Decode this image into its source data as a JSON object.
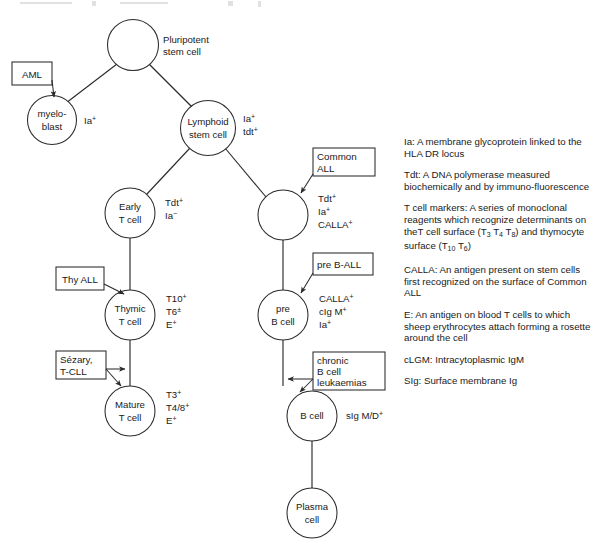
{
  "diagram": {
    "title_fragment": "",
    "nodes": [
      {
        "id": "pluripotent",
        "label_lines": [
          "Pluripotent",
          "stem cell"
        ],
        "label_position": "right",
        "markers": []
      },
      {
        "id": "myeloblast",
        "label_lines": [
          "myelo-",
          "blast"
        ],
        "label_position": "inside",
        "markers": [
          {
            "base": "Ia",
            "sup": "+"
          }
        ]
      },
      {
        "id": "lymphoid",
        "label_lines": [
          "Lymphoid",
          "stem cell"
        ],
        "label_position": "inside",
        "markers": [
          {
            "base": "Ia",
            "sup": "+"
          },
          {
            "base": "tdt",
            "sup": "+"
          }
        ]
      },
      {
        "id": "early-t",
        "label_lines": [
          "Early",
          "T cell"
        ],
        "label_position": "inside",
        "markers": [
          {
            "base": "Tdt",
            "sup": "+"
          },
          {
            "base": "Ia",
            "sup": "−"
          }
        ]
      },
      {
        "id": "common-all",
        "label_lines": [],
        "label_position": "inside",
        "markers": [
          {
            "base": "Tdt",
            "sup": "+"
          },
          {
            "base": "Ia",
            "sup": "+"
          },
          {
            "base": "CALLA",
            "sup": "+"
          }
        ]
      },
      {
        "id": "thymic-t",
        "label_lines": [
          "Thymic",
          "T cell"
        ],
        "label_position": "inside",
        "markers": [
          {
            "base": "T10",
            "sup": "+"
          },
          {
            "base": "T6",
            "sup": "±"
          },
          {
            "base": "E",
            "sup": "+"
          }
        ]
      },
      {
        "id": "pre-b",
        "label_lines": [
          "pre",
          "B cell"
        ],
        "label_position": "inside",
        "markers": [
          {
            "base": "CALLA",
            "sup": "+"
          },
          {
            "base": "cIg M",
            "sup": "+"
          },
          {
            "base": "Ia",
            "sup": "+"
          }
        ]
      },
      {
        "id": "mature-t",
        "label_lines": [
          "Mature",
          "T cell"
        ],
        "label_position": "inside",
        "markers": [
          {
            "base": "T3",
            "sup": "+"
          },
          {
            "base": "T4/8",
            "sup": "+"
          },
          {
            "base": "E",
            "sup": "+"
          }
        ]
      },
      {
        "id": "b-cell",
        "label_lines": [
          "B cell"
        ],
        "label_position": "inside",
        "markers": [
          {
            "base": "sIg M/D",
            "sup": "+"
          }
        ]
      },
      {
        "id": "plasma",
        "label_lines": [
          "Plasma",
          "cell"
        ],
        "label_position": "inside",
        "markers": []
      }
    ],
    "disease_boxes": [
      {
        "id": "aml",
        "lines": [
          "AML"
        ],
        "target": "myeloblast"
      },
      {
        "id": "thy-all",
        "lines": [
          "Thy ALL"
        ],
        "target": "thymic-t"
      },
      {
        "id": "sezary-tcll",
        "lines": [
          "Sézary,",
          "T-CLL"
        ],
        "target": "mature-t"
      },
      {
        "id": "common-all-box",
        "lines": [
          "Common",
          "ALL"
        ],
        "target": "common-all"
      },
      {
        "id": "pre-b-all",
        "lines": [
          "pre B-ALL"
        ],
        "target": "pre-b"
      },
      {
        "id": "chronic-b",
        "lines": [
          "chronic",
          "B cell",
          "leukaemias"
        ],
        "target": "b-cell"
      }
    ]
  },
  "legend": {
    "entries": [
      {
        "id": "ia",
        "html": "Ia: A membrane glycoprotein linked to the HLA DR locus"
      },
      {
        "id": "tdt",
        "html": "Tdt: A DNA polymerase measured biochemically and by immuno-fluorescence"
      },
      {
        "id": "t-cell-markers",
        "html": "T cell markers: A series of monoclonal reagents which recognize determinants on theT cell surface (T<sub>3</sub> T<sub>4</sub> T<sub>8</sub>) and thymocyte surface (T<sub>10</sub> T<sub>6</sub>)"
      },
      {
        "id": "calla",
        "html": "CALLA: An antigen present on stem cells first recognized on the surface of Common ALL"
      },
      {
        "id": "e",
        "html": "E: An antigen on blood T cells to which sheep erythrocytes attach forming a rosette around the cell"
      },
      {
        "id": "clgm",
        "html": "cLGM: Intracytoplasmic IgM"
      },
      {
        "id": "slg",
        "html": "SIg: Surface membrane Ig"
      }
    ]
  },
  "colors": {
    "ink": "#2b2b2b",
    "paper": "#ffffff"
  }
}
